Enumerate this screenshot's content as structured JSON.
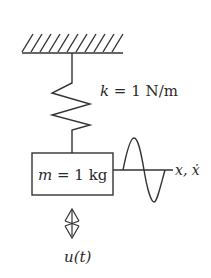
{
  "diagram": {
    "type": "spring-mass system",
    "ground": {
      "label": "fixed support"
    },
    "spring": {
      "label_var": "k",
      "label_eq": " = 1 N/m"
    },
    "mass": {
      "label_var": "m",
      "label_eq": " = 1 kg"
    },
    "state_output": {
      "label_x": "x",
      "label_sep": ", ",
      "label_xdot": "ẋ"
    },
    "input": {
      "label": "u(t)"
    },
    "colors": {
      "line": "#333333",
      "text": "#2a2a2a",
      "background": "#ffffff"
    }
  }
}
